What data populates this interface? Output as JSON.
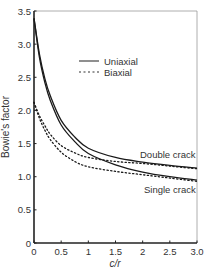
{
  "chart_data": {
    "type": "line",
    "title": "",
    "xlabel": "c/r",
    "ylabel": "Bowie's factor",
    "xlim": [
      0,
      3.0
    ],
    "ylim": [
      0,
      3.5
    ],
    "xticks": [
      "0",
      "0.5",
      "1",
      "1.5",
      "2",
      "2.5",
      "3.0"
    ],
    "yticks": [
      "0",
      "0.5",
      "1.0",
      "1.5",
      "2.0",
      "2.5",
      "3.0",
      "3.5"
    ],
    "grid": false,
    "legend": {
      "position": "upper right",
      "entries": [
        {
          "label": "Uniaxial",
          "style": "solid"
        },
        {
          "label": "Biaxial",
          "style": "dotted"
        }
      ]
    },
    "annotations": [
      "Double crack",
      "Single crack"
    ],
    "x": [
      0,
      0.1,
      0.2,
      0.3,
      0.5,
      0.75,
      1.0,
      1.5,
      2.0,
      2.5,
      3.0
    ],
    "series": [
      {
        "name": "Uniaxial - Double crack",
        "style": "solid",
        "values": [
          3.39,
          2.85,
          2.48,
          2.22,
          1.85,
          1.6,
          1.43,
          1.29,
          1.22,
          1.17,
          1.13
        ]
      },
      {
        "name": "Uniaxial - Single crack",
        "style": "solid",
        "values": [
          3.39,
          2.8,
          2.42,
          2.15,
          1.78,
          1.53,
          1.35,
          1.18,
          1.07,
          1.0,
          0.95
        ]
      },
      {
        "name": "Biaxial - Double crack",
        "style": "dotted",
        "values": [
          2.12,
          1.92,
          1.77,
          1.64,
          1.47,
          1.36,
          1.29,
          1.23,
          1.2,
          1.16,
          1.12
        ]
      },
      {
        "name": "Biaxial - Single crack",
        "style": "dotted",
        "values": [
          2.12,
          1.88,
          1.7,
          1.56,
          1.37,
          1.23,
          1.15,
          1.08,
          1.03,
          0.98,
          0.93
        ]
      }
    ]
  }
}
